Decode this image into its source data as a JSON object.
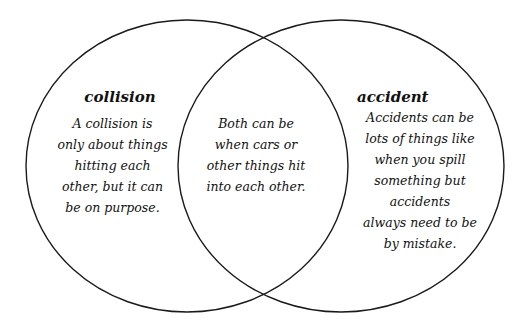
{
  "diagram": {
    "type": "venn",
    "stroke_color": "#1a1a1a",
    "background": "#ffffff",
    "left": {
      "title": "collision",
      "text": "A collision is\nonly about things\nhitting each\nother, but it can\nbe on purpose."
    },
    "overlap": {
      "text": "Both can be\nwhen cars or\nother things hit\ninto each other."
    },
    "right": {
      "title": "accident",
      "text": "Accidents can be\nlots of things like\nwhen you spill\nsomething but\naccidents\nalways need to be\nby mistake."
    }
  }
}
